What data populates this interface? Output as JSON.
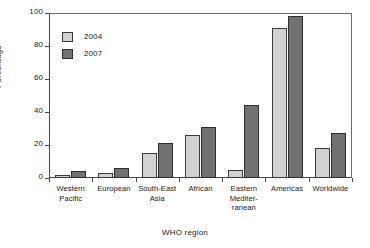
{
  "chart_data": {
    "type": "bar",
    "title": "",
    "xlabel": "WHO region",
    "ylabel": "Percentage",
    "ylim": [
      0,
      100
    ],
    "yticks": [
      0,
      20,
      40,
      60,
      80,
      100
    ],
    "grid": false,
    "legend_position": "top-left",
    "categories": [
      "Western Pacific",
      "European",
      "South-East Asia",
      "African",
      "Eastern Mediterranean",
      "Americas",
      "Worldwide"
    ],
    "category_label_lines": [
      [
        "Western",
        "Pacific"
      ],
      [
        "European"
      ],
      [
        "South-East",
        "Asia"
      ],
      [
        "African"
      ],
      [
        "Eastern",
        "Mediter-",
        "ranean"
      ],
      [
        "Americas"
      ],
      [
        "Worldwide"
      ]
    ],
    "series": [
      {
        "name": "2004",
        "color": "#d2d2d2",
        "values": [
          2,
          3,
          15,
          26,
          5,
          91,
          18
        ]
      },
      {
        "name": "2007",
        "color": "#717171",
        "values": [
          4,
          6,
          21,
          31,
          44,
          98,
          27
        ]
      }
    ]
  },
  "axis": {
    "y_title": "Percentage",
    "x_title": "WHO region",
    "y_tick_labels": [
      "0",
      "20",
      "40",
      "60",
      "80",
      "100"
    ]
  },
  "legend": {
    "items": [
      {
        "label": "2004",
        "swatch": "light-gray"
      },
      {
        "label": "2007",
        "swatch": "dark-gray"
      }
    ]
  }
}
